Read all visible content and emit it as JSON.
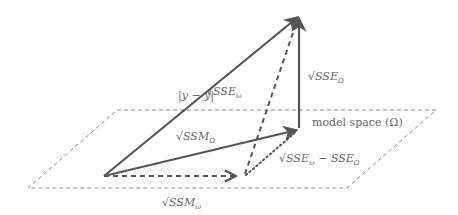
{
  "diagram": {
    "plane_label": "model space (Ω)",
    "labels": {
      "y_minus_ybar": {
        "main": "|y − ȳ|"
      },
      "sse_omega_small": {
        "root": "√",
        "main": "SSE",
        "sub": "ω"
      },
      "sse_omega_big": {
        "root": "√",
        "main": "SSE",
        "sub": "Ω"
      },
      "ssm_omega_big": {
        "root": "√",
        "main": "SSM",
        "sub": "Ω"
      },
      "ssm_omega_small": {
        "root": "√",
        "main": "SSM",
        "sub": "ω"
      },
      "sse_diff": {
        "root": "√",
        "main": "SSE",
        "sub": "ω",
        "minus": " − ",
        "main2": "SSE",
        "sub2": "Ω"
      }
    },
    "vectors": [
      {
        "name": "y-vector",
        "from": "origin",
        "to": "y",
        "style": "solid"
      },
      {
        "name": "ssm-big-omega-vector",
        "from": "origin",
        "to": "proj_Omega",
        "style": "solid"
      },
      {
        "name": "sse-big-omega-vector",
        "from": "proj_Omega",
        "to": "y",
        "style": "solid"
      },
      {
        "name": "ssm-small-omega-vector",
        "from": "origin",
        "to": "proj_omega",
        "style": "dashed"
      },
      {
        "name": "sse-small-omega-vector",
        "from": "proj_omega",
        "to": "y",
        "style": "dashed"
      },
      {
        "name": "sse-diff-vector",
        "from": "proj_omega",
        "to": "proj_Omega",
        "style": "dotted"
      }
    ],
    "colors": {
      "line": "#555555",
      "text": "#666666",
      "plane": "#777777"
    }
  }
}
